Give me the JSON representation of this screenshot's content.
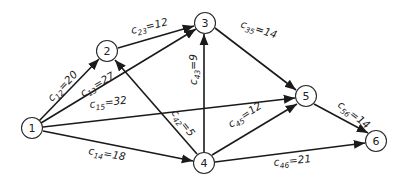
{
  "diagram": {
    "type": "directed-network",
    "nodes": [
      {
        "id": "1",
        "label": "1",
        "x": 32,
        "y": 128
      },
      {
        "id": "2",
        "label": "2",
        "x": 107,
        "y": 51
      },
      {
        "id": "3",
        "label": "3",
        "x": 205,
        "y": 23
      },
      {
        "id": "4",
        "label": "4",
        "x": 204,
        "y": 163
      },
      {
        "id": "5",
        "label": "5",
        "x": 306,
        "y": 96
      },
      {
        "id": "6",
        "label": "6",
        "x": 376,
        "y": 141
      }
    ],
    "edges": [
      {
        "from": "1",
        "to": "2",
        "var": "c",
        "sub": "12",
        "value": "20",
        "text": "=20"
      },
      {
        "from": "1",
        "to": "3",
        "var": "c",
        "sub": "13",
        "value": "27",
        "text": "=27"
      },
      {
        "from": "1",
        "to": "5",
        "var": "c",
        "sub": "15",
        "value": "32",
        "text": "=32"
      },
      {
        "from": "1",
        "to": "4",
        "var": "c",
        "sub": "14",
        "value": "18",
        "text": "=18"
      },
      {
        "from": "2",
        "to": "3",
        "var": "c",
        "sub": "23",
        "value": "12",
        "text": "=12"
      },
      {
        "from": "4",
        "to": "3",
        "var": "c",
        "sub": "43",
        "value": "9",
        "text": "=9"
      },
      {
        "from": "4",
        "to": "2",
        "var": "c",
        "sub": "42",
        "value": "5",
        "text": "=5"
      },
      {
        "from": "3",
        "to": "5",
        "var": "c",
        "sub": "35",
        "value": "14",
        "text": "=14"
      },
      {
        "from": "4",
        "to": "5",
        "var": "c",
        "sub": "45",
        "value": "12",
        "text": "=12"
      },
      {
        "from": "4",
        "to": "6",
        "var": "c",
        "sub": "46",
        "value": "21",
        "text": "=21"
      },
      {
        "from": "5",
        "to": "6",
        "var": "c",
        "sub": "56",
        "value": "14",
        "text": "=14"
      }
    ]
  }
}
